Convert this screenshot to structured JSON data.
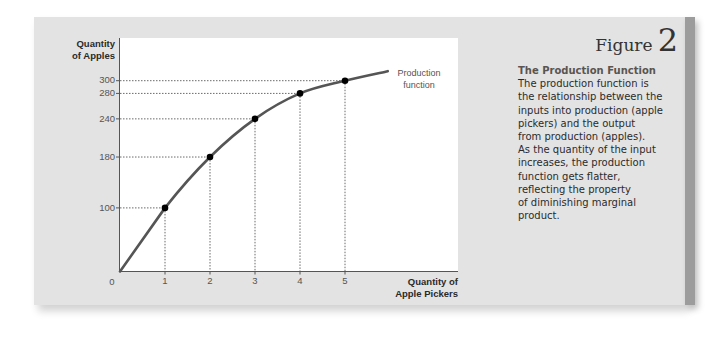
{
  "figure": {
    "label_word": "Figure",
    "label_number": "2",
    "caption_title": "The Production Function",
    "caption_body": "The production function is\nthe relationship between the\ninputs into production (apple\npickers) and the output\nfrom production (apples).\nAs the quantity of the input\nincreases, the production\nfunction gets flatter,\nreflecting the property\nof diminishing marginal\nproduct."
  },
  "axes": {
    "y_label_line1": "Quantity",
    "y_label_line2": "of Apples",
    "x_label_line1": "Quantity of",
    "x_label_line2": "Apple Pickers",
    "y_ticks": [
      "300",
      "280",
      "240",
      "180",
      "100"
    ],
    "x_ticks": [
      "1",
      "2",
      "3",
      "4",
      "5"
    ],
    "origin": "0"
  },
  "curve_label": {
    "line1": "Production",
    "line2": "function"
  },
  "colors": {
    "panel": "#e3e3e3",
    "panel_edge": "#9c9c9c",
    "curve": "#555555",
    "points": "#000000"
  },
  "chart_data": {
    "type": "line",
    "xlabel": "Quantity of Apple Pickers",
    "ylabel": "Quantity of Apples",
    "x": [
      0,
      1,
      2,
      3,
      4,
      5
    ],
    "series": [
      {
        "name": "Production function",
        "values": [
          0,
          100,
          180,
          240,
          280,
          300
        ]
      }
    ],
    "x_ticks": [
      1,
      2,
      3,
      4,
      5
    ],
    "y_ticks": [
      100,
      180,
      240,
      280,
      300
    ],
    "grid": false,
    "dotted_guides": true,
    "annotations": [
      "Production function"
    ],
    "xlim": [
      0,
      7.5
    ],
    "ylim": [
      0,
      365
    ]
  }
}
